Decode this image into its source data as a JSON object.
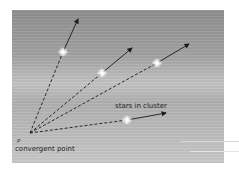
{
  "diagram": {
    "labels": {
      "stars": "stars in cluster",
      "point_symbol": "P",
      "convergent": "convergent point"
    },
    "convergent_point": {
      "x": 30,
      "y": 133
    },
    "stars": [
      {
        "id": "star-1",
        "x": 63,
        "y": 52,
        "arrow_tip": {
          "x": 78,
          "y": 19
        }
      },
      {
        "id": "star-2",
        "x": 102,
        "y": 73,
        "arrow_tip": {
          "x": 132,
          "y": 48
        }
      },
      {
        "id": "star-3",
        "x": 157,
        "y": 63,
        "arrow_tip": {
          "x": 189,
          "y": 44
        }
      },
      {
        "id": "star-4",
        "x": 127,
        "y": 120,
        "arrow_tip": {
          "x": 166,
          "y": 113
        }
      }
    ],
    "colors": {
      "line": "#1a1a1a",
      "star": "#ffffff",
      "text": "#1e1e1e"
    }
  }
}
